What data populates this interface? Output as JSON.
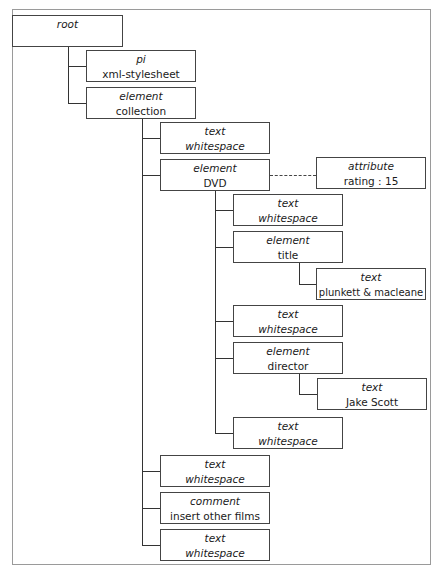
{
  "diagram": {
    "nodes": {
      "root": {
        "type": "root",
        "value": ""
      },
      "pi": {
        "type": "pi",
        "value": "xml-stylesheet"
      },
      "collection": {
        "type": "element",
        "value": "collection"
      },
      "ws1": {
        "type": "text",
        "value": "whitespace"
      },
      "dvd": {
        "type": "element",
        "value": "DVD"
      },
      "attr": {
        "type": "attribute",
        "value": "rating : 15"
      },
      "ws2": {
        "type": "text",
        "value": "whitespace"
      },
      "title": {
        "type": "element",
        "value": "title"
      },
      "titletext": {
        "type": "text",
        "value": "plunkett & macleane"
      },
      "ws3": {
        "type": "text",
        "value": "whitespace"
      },
      "director": {
        "type": "element",
        "value": "director"
      },
      "directortext": {
        "type": "text",
        "value": "Jake Scott"
      },
      "ws4": {
        "type": "text",
        "value": "whitespace"
      },
      "ws5": {
        "type": "text",
        "value": "whitespace"
      },
      "comment": {
        "type": "comment",
        "value": "insert other films"
      },
      "ws6": {
        "type": "text",
        "value": "whitespace"
      }
    },
    "edges": [
      [
        "root",
        "pi"
      ],
      [
        "root",
        "collection"
      ],
      [
        "collection",
        "ws1"
      ],
      [
        "collection",
        "dvd"
      ],
      [
        "collection",
        "ws5"
      ],
      [
        "collection",
        "comment"
      ],
      [
        "collection",
        "ws6"
      ],
      [
        "dvd",
        "attr",
        "dashed"
      ],
      [
        "dvd",
        "ws2"
      ],
      [
        "dvd",
        "title"
      ],
      [
        "dvd",
        "ws3"
      ],
      [
        "dvd",
        "director"
      ],
      [
        "dvd",
        "ws4"
      ],
      [
        "title",
        "titletext"
      ],
      [
        "director",
        "directortext"
      ]
    ]
  }
}
